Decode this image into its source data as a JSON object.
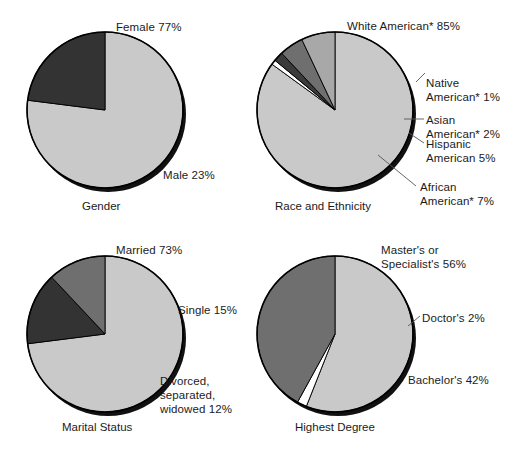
{
  "figure": {
    "width": 516,
    "height": 459,
    "background": "#ffffff",
    "text_color": "#1b1b1b"
  },
  "palette": {
    "light_gray": "#c9c9c9",
    "mid_gray": "#8e8e8e",
    "dark_gray": "#5a5a5a",
    "near_black": "#333333",
    "white": "#ffffff",
    "shadow": "#111111",
    "outline": "#000000",
    "leader_line": "#555555"
  },
  "charts": [
    {
      "id": "gender",
      "caption": "Gender",
      "center": [
        105,
        110
      ],
      "radius": 78,
      "start_angle": -90,
      "chart_data": {
        "type": "pie",
        "title": "Gender",
        "labels": [
          "Female",
          "Male"
        ],
        "values": [
          77,
          23
        ],
        "units": "percent",
        "slice_labels": [
          "Female 77%",
          "Male 23%"
        ],
        "colors": [
          "#c9c9c9",
          "#333333"
        ]
      },
      "labels": [
        {
          "name": "slice-label-female",
          "text": "Female 77%",
          "x": 116,
          "y": 20,
          "align": "left"
        },
        {
          "name": "slice-label-male",
          "text": "Male 23%",
          "x": 163,
          "y": 168,
          "align": "left"
        }
      ],
      "caption_pos": {
        "x": 82,
        "y": 199
      }
    },
    {
      "id": "race",
      "caption": "Race and Ethnicity",
      "center": [
        335,
        110
      ],
      "radius": 78,
      "start_angle": -90,
      "chart_data": {
        "type": "pie",
        "title": "Race and Ethnicity",
        "labels": [
          "White American*",
          "Native American*",
          "Asian American*",
          "Hispanic American",
          "African American*"
        ],
        "values": [
          85,
          1,
          2,
          5,
          7
        ],
        "units": "percent",
        "slice_labels": [
          "White American* 85%",
          "Native American* 1%",
          "Asian American* 2%",
          "Hispanic American 5%",
          "African American* 7%"
        ],
        "colors": [
          "#c9c9c9",
          "#ffffff",
          "#3b3b3b",
          "#6f6f6f",
          "#a8a8a8"
        ]
      },
      "labels": [
        {
          "name": "slice-label-white-american",
          "text": "White American* 85%",
          "x": 347,
          "y": 19,
          "align": "left"
        },
        {
          "name": "slice-label-native-american",
          "text": "Native\nAmerican* 1%",
          "x": 426,
          "y": 76,
          "align": "left",
          "two_line": true
        },
        {
          "name": "slice-label-asian-american",
          "text": "Asian\nAmerican* 2%",
          "x": 426,
          "y": 113,
          "align": "left",
          "two_line": true
        },
        {
          "name": "slice-label-hispanic-american",
          "text": "Hispanic\nAmerican 5%",
          "x": 426,
          "y": 137,
          "align": "left",
          "two_line": true
        },
        {
          "name": "slice-label-african-american",
          "text": "African\nAmerican* 7%",
          "x": 420,
          "y": 180,
          "align": "left",
          "two_line": true
        }
      ],
      "leaders": [
        {
          "name": "leader-line-native-american",
          "x1": 416,
          "y1": 82,
          "x2": 425,
          "y2": 73
        },
        {
          "name": "leader-line-asian-american",
          "x1": 404,
          "y1": 119,
          "x2": 424,
          "y2": 119
        },
        {
          "name": "leader-line-hispanic-american",
          "x1": 409,
          "y1": 133,
          "x2": 424,
          "y2": 143
        },
        {
          "name": "leader-line-african-american",
          "x1": 378,
          "y1": 155,
          "x2": 416,
          "y2": 186
        }
      ],
      "caption_pos": {
        "x": 275,
        "y": 199
      }
    },
    {
      "id": "marital",
      "caption": "Marital Status",
      "center": [
        105,
        334
      ],
      "radius": 78,
      "start_angle": -90,
      "chart_data": {
        "type": "pie",
        "title": "Marital Status",
        "labels": [
          "Married",
          "Single",
          "Divorced, separated, widowed"
        ],
        "values": [
          73,
          15,
          12
        ],
        "units": "percent",
        "slice_labels": [
          "Married 73%",
          "Single 15%",
          "Divorced, separated, widowed 12%"
        ],
        "colors": [
          "#c9c9c9",
          "#333333",
          "#6f6f6f"
        ]
      },
      "labels": [
        {
          "name": "slice-label-married",
          "text": "Married 73%",
          "x": 116,
          "y": 243,
          "align": "left"
        },
        {
          "name": "slice-label-single",
          "text": "Single 15%",
          "x": 178,
          "y": 303,
          "align": "left"
        },
        {
          "name": "slice-label-divorced",
          "text": "Divorced, separated,\nwidowed 12%",
          "x": 160,
          "y": 374,
          "align": "left",
          "two_line": true
        }
      ],
      "caption_pos": {
        "x": 62,
        "y": 420
      }
    },
    {
      "id": "degree",
      "caption": "Highest Degree",
      "center": [
        335,
        334
      ],
      "radius": 78,
      "start_angle": -90,
      "chart_data": {
        "type": "pie",
        "title": "Highest Degree",
        "labels": [
          "Master's or Specialist's",
          "Doctor's",
          "Bachelor's"
        ],
        "values": [
          56,
          2,
          42
        ],
        "units": "percent",
        "slice_labels": [
          "Master's or Specialist's 56%",
          "Doctor's 2%",
          "Bachelor's 42%"
        ],
        "colors": [
          "#c9c9c9",
          "#ffffff",
          "#6f6f6f"
        ]
      },
      "labels": [
        {
          "name": "slice-label-masters",
          "text": "Master's or\nSpecialist's 56%",
          "x": 381,
          "y": 243,
          "align": "left",
          "two_line": true
        },
        {
          "name": "slice-label-doctors",
          "text": "Doctor's 2%",
          "x": 422,
          "y": 311,
          "align": "left"
        },
        {
          "name": "slice-label-bachelors",
          "text": "Bachelor's 42%",
          "x": 408,
          "y": 373,
          "align": "left"
        }
      ],
      "leaders": [
        {
          "name": "leader-line-doctors",
          "x1": 408,
          "y1": 326,
          "x2": 420,
          "y2": 316
        }
      ],
      "caption_pos": {
        "x": 295,
        "y": 420
      }
    }
  ]
}
